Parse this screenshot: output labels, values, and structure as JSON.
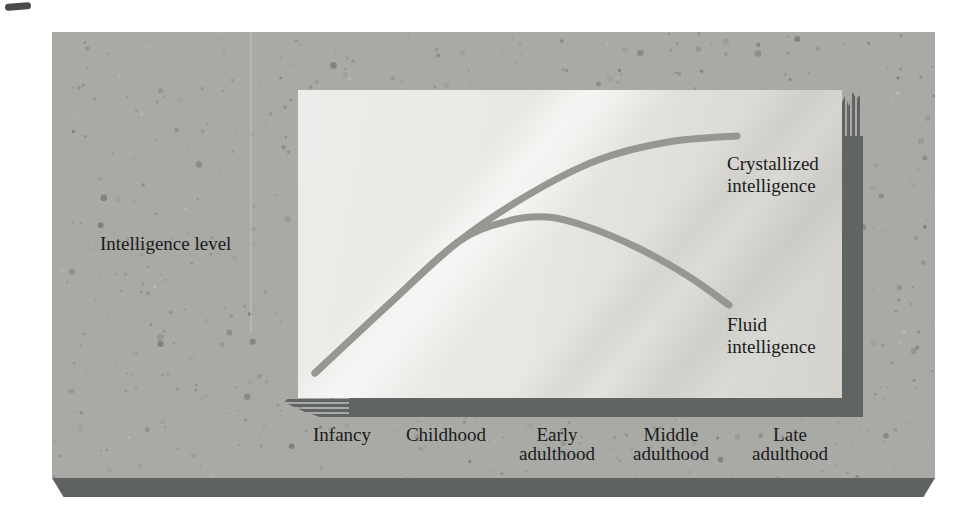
{
  "figure": {
    "y_axis_label": "Intelligence level",
    "curve_labels": {
      "crystallized": {
        "line1": "Crystallized",
        "line2": "intelligence"
      },
      "fluid": {
        "line1": "Fluid",
        "line2": "intelligence"
      }
    },
    "x_axis_labels": [
      {
        "line1": "Infancy",
        "line2": ""
      },
      {
        "line1": "Childhood",
        "line2": ""
      },
      {
        "line1": "Early",
        "line2": "adulthood"
      },
      {
        "line1": "Middle",
        "line2": "adulthood"
      },
      {
        "line1": "Late",
        "line2": "adulthood"
      }
    ]
  },
  "colors": {
    "slab": "#a9a9a6",
    "slab_edge": "#5e6261",
    "panel_shadow": "#606463",
    "curve": "#949792",
    "text": "#1b1b1b"
  },
  "chart_data": {
    "type": "line",
    "title": "",
    "xlabel": "life stage",
    "ylabel": "Intelligence level",
    "categories": [
      "Infancy",
      "Childhood",
      "Early adulthood",
      "Middle adulthood",
      "Late adulthood"
    ],
    "series": [
      {
        "name": "Crystallized intelligence",
        "values": [
          8,
          48,
          73,
          83,
          85
        ]
      },
      {
        "name": "Fluid intelligence",
        "values": [
          8,
          48,
          58,
          42,
          30
        ]
      }
    ],
    "value_units": "relative level, percent of panel height (no numeric scale shown in figure)",
    "ylim": [
      0,
      100
    ],
    "grid": false,
    "legend_position": "labels beside curve ends",
    "render_points": {
      "viewbox": [
        544,
        308
      ],
      "stroke_width": 7,
      "crystallized": [
        [
          17,
          283
        ],
        [
          90,
          215
        ],
        [
          160,
          152
        ],
        [
          230,
          105
        ],
        [
          300,
          70
        ],
        [
          370,
          52
        ],
        [
          439,
          46
        ]
      ],
      "fluid": [
        [
          17,
          283
        ],
        [
          90,
          215
        ],
        [
          160,
          152
        ],
        [
          210,
          131
        ],
        [
          250,
          127
        ],
        [
          290,
          137
        ],
        [
          340,
          158
        ],
        [
          390,
          186
        ],
        [
          431,
          215
        ]
      ]
    }
  }
}
